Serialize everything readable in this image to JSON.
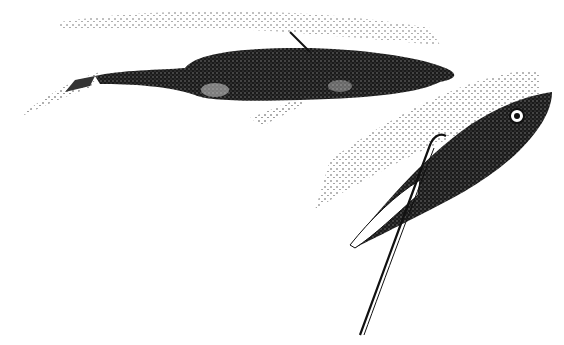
{
  "image": {
    "description": "Stippled black-and-white illustration of two fish swimming with a trail of stipple dots; one long slender fish with mottled body swims right, another fish with a large eye and a hook/line attached swims up-right",
    "colors": {
      "background": "#ffffff",
      "ink": "#111111",
      "mid": "#3a3a3a"
    },
    "elements": [
      "long-fish",
      "hooked-fish",
      "fishing-line",
      "stipple-trail-top",
      "stipple-trail-right"
    ]
  }
}
